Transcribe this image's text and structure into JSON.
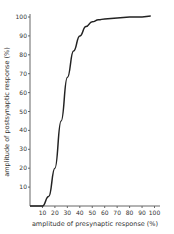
{
  "chart_data": {
    "type": "line",
    "title": "",
    "xlabel": "amplitude of presynaptic response (%)",
    "ylabel": "amplitude of postsynaptic response (%)",
    "xlim": [
      0,
      100
    ],
    "ylim": [
      0,
      100
    ],
    "x_ticks": [
      "10",
      "20",
      "30",
      "40",
      "50",
      "60",
      "70",
      "80",
      "90",
      "100"
    ],
    "y_ticks": [
      "10",
      "20",
      "30",
      "40",
      "50",
      "60",
      "70",
      "80",
      "90",
      "100"
    ],
    "grid": false,
    "legend": null,
    "series": [
      {
        "name": "input-output curve",
        "x": [
          0,
          10,
          15,
          20,
          25,
          30,
          35,
          40,
          45,
          50,
          55,
          60,
          70,
          80,
          90,
          97
        ],
        "y": [
          0,
          0,
          5,
          20,
          45,
          68,
          82,
          90,
          95,
          97.5,
          98.5,
          99,
          99.5,
          100,
          100,
          100.5
        ]
      }
    ]
  }
}
